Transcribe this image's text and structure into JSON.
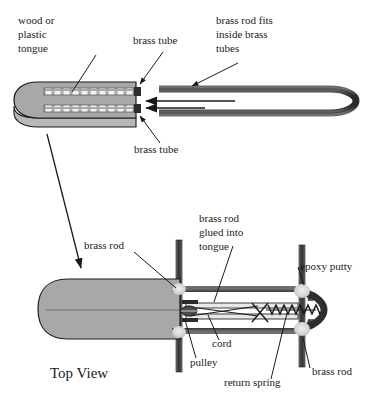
{
  "figure": {
    "title_label": "Top View",
    "colors": {
      "tongue_fill": "#a8a8a8",
      "tongue_fill_lower": "#a8a8a8",
      "outline": "#1a1a1a",
      "tube_dark": "#3a3a3a",
      "tube_mid": "#7a7a7a",
      "epoxy": "#d8d8d8",
      "background": "#ffffff",
      "dash_white": "#f2f2f2"
    },
    "upper_view": {
      "labels": [
        {
          "name": "wood-or-plastic-tongue",
          "lines": [
            "wood or",
            "plastic",
            "tongue"
          ],
          "x": 18,
          "y": 24
        },
        {
          "name": "brass-tube-top",
          "lines": [
            "brass tube"
          ],
          "x": 133,
          "y": 44
        },
        {
          "name": "brass-rod-fits-inside-brass-tubes",
          "lines": [
            "brass rod fits",
            "inside brass",
            "tubes"
          ],
          "x": 216,
          "y": 24
        },
        {
          "name": "brass-tube-bottom",
          "lines": [
            "brass tube"
          ],
          "x": 134,
          "y": 153
        }
      ]
    },
    "lower_view": {
      "labels": [
        {
          "name": "brass-rod-left",
          "lines": [
            "brass rod"
          ],
          "x": 84,
          "y": 249
        },
        {
          "name": "brass-rod-glued-into-tongue",
          "lines": [
            "brass rod",
            "glued into",
            "tongue"
          ],
          "x": 199,
          "y": 222
        },
        {
          "name": "epoxy-putty",
          "lines": [
            "epoxy putty"
          ],
          "x": 300,
          "y": 270
        },
        {
          "name": "cord",
          "lines": [
            "cord"
          ],
          "x": 212,
          "y": 347
        },
        {
          "name": "pulley",
          "lines": [
            "pulley"
          ],
          "x": 190,
          "y": 366
        },
        {
          "name": "return-spring",
          "lines": [
            "return spring"
          ],
          "x": 224,
          "y": 386
        },
        {
          "name": "brass-rod-right",
          "lines": [
            "brass rod"
          ],
          "x": 312,
          "y": 375
        }
      ]
    }
  }
}
